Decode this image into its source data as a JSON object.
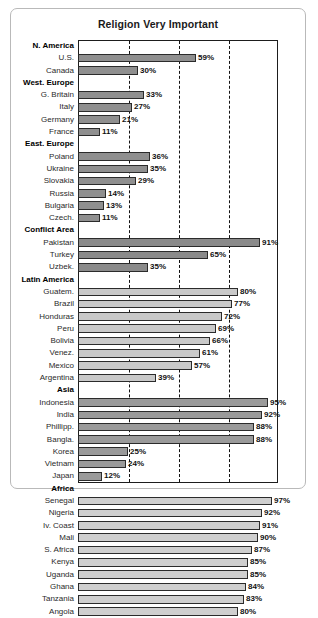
{
  "chart_data": {
    "type": "bar",
    "orientation": "horizontal",
    "title": "Religion Very Important",
    "xlabel": "",
    "ylabel": "",
    "xlim": [
      0,
      100
    ],
    "value_suffix": "%",
    "grid": true,
    "gridlines": [
      25,
      50,
      75
    ],
    "legend": "none",
    "groups": [
      {
        "name": "N. America",
        "tone": "tone-a",
        "items": [
          {
            "label": "U.S.",
            "value": 59,
            "display": "59%"
          },
          {
            "label": "Canada",
            "value": 30,
            "display": "30%"
          }
        ]
      },
      {
        "name": "West. Europe",
        "tone": "tone-a",
        "items": [
          {
            "label": "G. Britain",
            "value": 33,
            "display": "33%"
          },
          {
            "label": "Italy",
            "value": 27,
            "display": "27%"
          },
          {
            "label": "Germany",
            "value": 21,
            "display": "21%"
          },
          {
            "label": "France",
            "value": 11,
            "display": "11%"
          }
        ]
      },
      {
        "name": "East. Europe",
        "tone": "tone-a",
        "items": [
          {
            "label": "Poland",
            "value": 36,
            "display": "36%"
          },
          {
            "label": "Ukraine",
            "value": 35,
            "display": "35%"
          },
          {
            "label": "Slovakia",
            "value": 29,
            "display": "29%"
          },
          {
            "label": "Russia",
            "value": 14,
            "display": "14%"
          },
          {
            "label": "Bulgaria",
            "value": 13,
            "display": "13%"
          },
          {
            "label": "Czech.",
            "value": 11,
            "display": "11%"
          }
        ]
      },
      {
        "name": "Conflict Area",
        "tone": "tone-b",
        "items": [
          {
            "label": "Pakistan",
            "value": 91,
            "display": "91%"
          },
          {
            "label": "Turkey",
            "value": 65,
            "display": "65%"
          },
          {
            "label": "Uzbek.",
            "value": 35,
            "display": "35%"
          }
        ]
      },
      {
        "name": "Latin America",
        "tone": "tone-c",
        "items": [
          {
            "label": "Guatem.",
            "value": 80,
            "display": "80%"
          },
          {
            "label": "Brazil",
            "value": 77,
            "display": "77%"
          },
          {
            "label": "Honduras",
            "value": 72,
            "display": "72%"
          },
          {
            "label": "Peru",
            "value": 69,
            "display": "69%"
          },
          {
            "label": "Bolivia",
            "value": 66,
            "display": "66%"
          },
          {
            "label": "Venez.",
            "value": 61,
            "display": "61%"
          },
          {
            "label": "Mexico",
            "value": 57,
            "display": "57%"
          },
          {
            "label": "Argentina",
            "value": 39,
            "display": "39%"
          }
        ]
      },
      {
        "name": "Asia",
        "tone": "tone-d",
        "items": [
          {
            "label": "Indonesia",
            "value": 95,
            "display": "95%"
          },
          {
            "label": "India",
            "value": 92,
            "display": "92%"
          },
          {
            "label": "Phillipp.",
            "value": 88,
            "display": "88%"
          },
          {
            "label": "Bangla.",
            "value": 88,
            "display": "88%"
          },
          {
            "label": "Korea",
            "value": 25,
            "display": "25%"
          },
          {
            "label": "Vietnam",
            "value": 24,
            "display": "24%"
          },
          {
            "label": "Japan",
            "value": 12,
            "display": "12%"
          }
        ]
      },
      {
        "name": "Africa",
        "tone": "tone-e",
        "items": [
          {
            "label": "Senegal",
            "value": 97,
            "display": "97%"
          },
          {
            "label": "Nigeria",
            "value": 92,
            "display": "92%"
          },
          {
            "label": "Iv. Coast",
            "value": 91,
            "display": "91%"
          },
          {
            "label": "Mali",
            "value": 90,
            "display": "90%"
          },
          {
            "label": "S. Africa",
            "value": 87,
            "display": "87%"
          },
          {
            "label": "Kenya",
            "value": 85,
            "display": "85%"
          },
          {
            "label": "Uganda",
            "value": 85,
            "display": "85%"
          },
          {
            "label": "Ghana",
            "value": 84,
            "display": "84%"
          },
          {
            "label": "Tanzania",
            "value": 83,
            "display": "83%"
          },
          {
            "label": "Angola",
            "value": 80,
            "display": "80%"
          }
        ]
      }
    ]
  }
}
